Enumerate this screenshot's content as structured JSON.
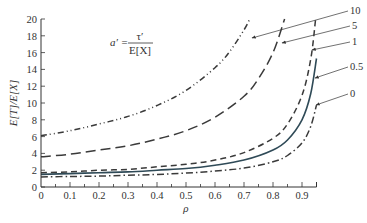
{
  "chart_data": {
    "type": "line",
    "title": "",
    "xlabel": "ρ",
    "ylabel": "E[T]/E[X]",
    "xlim": [
      0,
      0.95
    ],
    "ylim": [
      0,
      20
    ],
    "grid": false,
    "x_ticks": [
      "0",
      "0.1",
      "0.2",
      "0.3",
      "0.4",
      "0.5",
      "0.6",
      "0.7",
      "0.8",
      "0.9"
    ],
    "y_ticks": [
      "0",
      "2",
      "4",
      "6",
      "8",
      "10",
      "12",
      "14",
      "16",
      "18",
      "20"
    ],
    "annotation": {
      "lhs": "a′ =",
      "numerator": "τ′",
      "denominator": "E[X]"
    },
    "legend_position": "right, labels with leader arrows",
    "series": [
      {
        "name": "10",
        "style": "dash-dot-dot",
        "x": [
          0,
          0.1,
          0.2,
          0.3,
          0.4,
          0.5,
          0.6,
          0.65,
          0.7,
          0.72
        ],
        "values": [
          6.1,
          6.7,
          7.5,
          8.4,
          9.7,
          11.5,
          14.2,
          16.1,
          18.7,
          20.0
        ]
      },
      {
        "name": "5",
        "style": "long-dash",
        "x": [
          0,
          0.1,
          0.2,
          0.3,
          0.4,
          0.5,
          0.6,
          0.7,
          0.75,
          0.8,
          0.84
        ],
        "values": [
          3.6,
          3.9,
          4.4,
          4.9,
          5.7,
          6.7,
          8.3,
          10.8,
          12.9,
          16.0,
          20.0
        ]
      },
      {
        "name": "1",
        "style": "dashed",
        "x": [
          0,
          0.1,
          0.2,
          0.3,
          0.4,
          0.5,
          0.6,
          0.7,
          0.8,
          0.85,
          0.9,
          0.93,
          0.947
        ],
        "values": [
          1.7,
          1.8,
          2.0,
          2.1,
          2.4,
          2.7,
          3.2,
          4.1,
          5.8,
          7.5,
          10.9,
          15.2,
          20.0
        ]
      },
      {
        "name": "0.5",
        "style": "solid",
        "x": [
          0,
          0.1,
          0.2,
          0.3,
          0.4,
          0.5,
          0.6,
          0.7,
          0.8,
          0.85,
          0.9,
          0.93,
          0.95
        ],
        "values": [
          1.5,
          1.6,
          1.7,
          1.8,
          2.0,
          2.2,
          2.6,
          3.2,
          4.4,
          5.6,
          8.0,
          11.1,
          15.3
        ]
      },
      {
        "name": "0",
        "style": "dash-dot",
        "x": [
          0,
          0.1,
          0.2,
          0.3,
          0.4,
          0.5,
          0.6,
          0.7,
          0.8,
          0.85,
          0.9,
          0.93,
          0.95
        ],
        "values": [
          1.2,
          1.25,
          1.3,
          1.4,
          1.5,
          1.65,
          1.9,
          2.25,
          3.0,
          3.75,
          5.25,
          7.2,
          9.75
        ]
      }
    ]
  }
}
